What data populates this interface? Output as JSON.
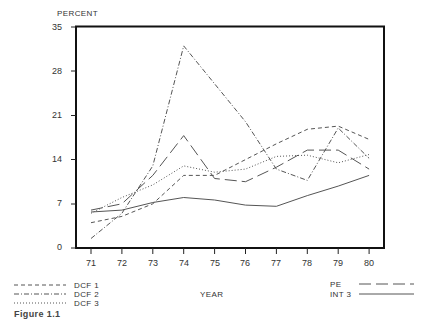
{
  "chart_data": {
    "type": "line",
    "title": "",
    "ylabel": "PERCENT",
    "xlabel": "YEAR",
    "ylim": [
      0,
      35
    ],
    "yticks": [
      0,
      7,
      14,
      21,
      28,
      35
    ],
    "ytick_labels": [
      "0",
      "7",
      "14",
      "21",
      "28",
      "35"
    ],
    "categories": [
      "71",
      "72",
      "73",
      "74",
      "75",
      "76",
      "77",
      "78",
      "79",
      "80"
    ],
    "grid": false,
    "legend_position": "bottom",
    "series": [
      {
        "name": "DCF 1",
        "style": "dashed",
        "values": [
          4.0,
          5.0,
          7.0,
          11.5,
          11.5,
          14.0,
          16.5,
          18.8,
          19.3,
          17.2
        ]
      },
      {
        "name": "DCF 2",
        "style": "dash-dot",
        "values": [
          1.5,
          5.5,
          13.0,
          32.0,
          26.0,
          20.0,
          12.5,
          10.7,
          19.0,
          14.2
        ]
      },
      {
        "name": "DCF 3",
        "style": "dotted",
        "values": [
          5.5,
          8.0,
          10.0,
          13.0,
          12.0,
          12.5,
          14.5,
          14.7,
          13.5,
          14.8
        ]
      },
      {
        "name": "PE",
        "style": "long-dash",
        "values": [
          6.0,
          7.0,
          11.5,
          17.8,
          11.0,
          10.5,
          12.8,
          15.5,
          15.5,
          12.5
        ]
      },
      {
        "name": "INT 3",
        "style": "solid",
        "values": [
          5.7,
          6.0,
          7.2,
          8.0,
          7.6,
          6.8,
          6.6,
          8.3,
          9.8,
          11.5
        ]
      }
    ],
    "caption_fragment": "Figure 1.1"
  },
  "labels": {
    "y_axis_title": "PERCENT",
    "x_axis_title": "YEAR",
    "caption": "Figure 1.1"
  },
  "legend": {
    "left": [
      "DCF 1",
      "DCF 2",
      "DCF 3"
    ],
    "right": [
      "PE",
      "INT 3"
    ]
  },
  "colors": {
    "frame": "#111111",
    "lines": "#555555"
  }
}
